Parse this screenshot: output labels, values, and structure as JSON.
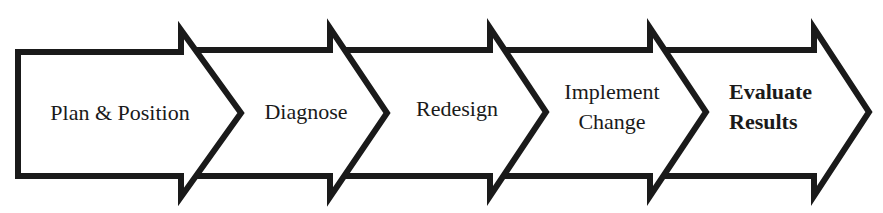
{
  "diagram": {
    "type": "process-flow-chevrons",
    "stroke_color": "#1a1a1a",
    "fill_color": "#ffffff",
    "steps": [
      {
        "label": "Plan & Position",
        "lines": [
          "Plan & Position"
        ],
        "bold": false
      },
      {
        "label": "Diagnose",
        "lines": [
          "Diagnose"
        ],
        "bold": false
      },
      {
        "label": "Redesign",
        "lines": [
          "Redesign"
        ],
        "bold": false
      },
      {
        "label": "Implement Change",
        "lines": [
          "Implement",
          "Change"
        ],
        "bold": false
      },
      {
        "label": "Evaluate Results",
        "lines": [
          "Evaluate",
          "Results"
        ],
        "bold": true
      }
    ]
  }
}
